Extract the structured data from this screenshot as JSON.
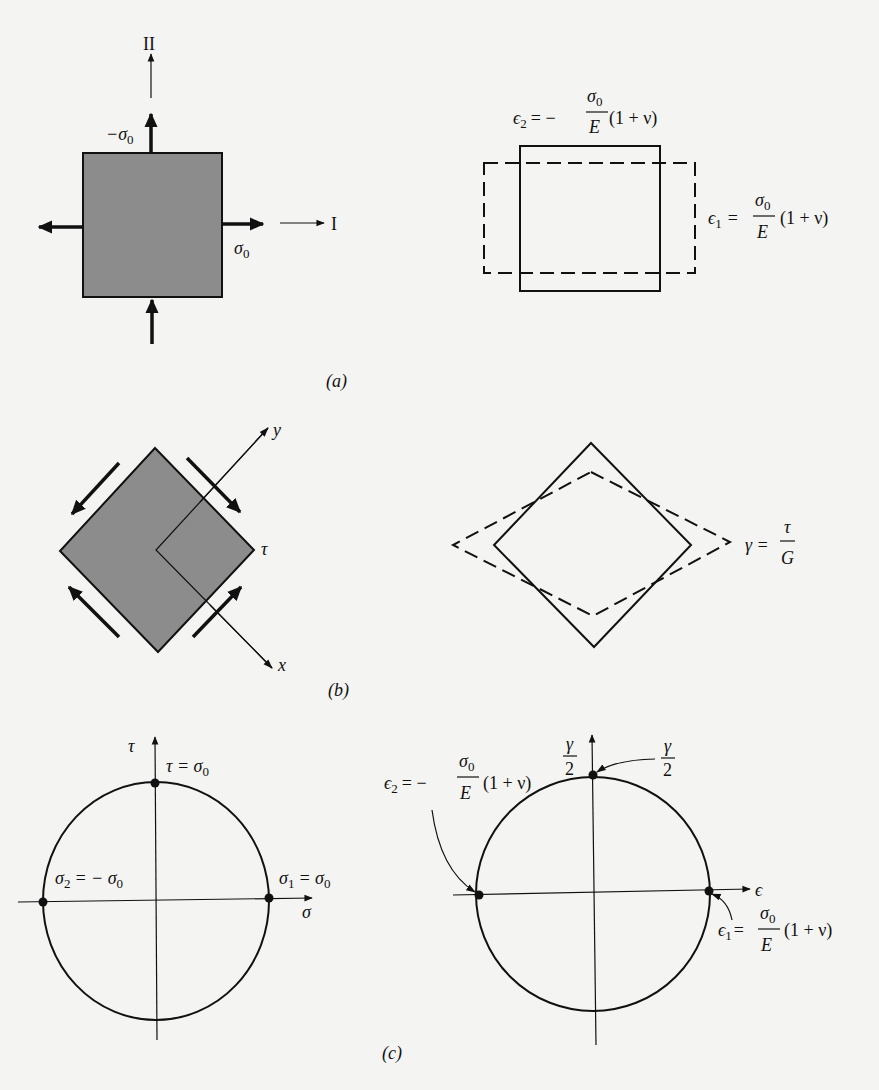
{
  "figure": {
    "panel_a": {
      "caption": "(a)",
      "axis_vertical_label": "II",
      "axis_horizontal_label": "I",
      "stress_top_label": "−σ",
      "stress_top_sub": "0",
      "stress_right_label": "σ",
      "stress_right_sub": "0",
      "strain2_lhs": "ϵ",
      "strain2_lhs_sub": "2",
      "strain2_eq": "= −",
      "strain2_num": "σ",
      "strain2_num_sub": "0",
      "strain2_den": "E",
      "strain2_tail": "(1 + ν)",
      "strain1_lhs": "ϵ",
      "strain1_lhs_sub": "1",
      "strain1_eq": "=",
      "strain1_num": "σ",
      "strain1_num_sub": "0",
      "strain1_den": "E",
      "strain1_tail": "(1 + ν)"
    },
    "panel_b": {
      "caption": "(b)",
      "axis_y_label": "y",
      "axis_x_label": "x",
      "shear_label": "τ",
      "gamma_lhs": "γ =",
      "gamma_num": "τ",
      "gamma_den": "G"
    },
    "panel_c": {
      "caption": "(c)",
      "left_circle": {
        "vertical_axis_label": "τ",
        "horizontal_axis_label": "σ",
        "top_point_label": "τ = σ",
        "top_point_sub": "0",
        "left_point_label": "σ",
        "left_point_sub": "2",
        "left_point_eq": "= − σ",
        "left_point_eq_sub": "0",
        "right_point_label": "σ",
        "right_point_sub": "1",
        "right_point_eq": "= σ",
        "right_point_eq_sub": "0"
      },
      "right_circle": {
        "vertical_axis_num": "γ",
        "vertical_axis_den": "2",
        "horizontal_axis_label": "ϵ",
        "top_point_num": "γ",
        "top_point_den": "2",
        "left_point_lhs": "ϵ",
        "left_point_lhs_sub": "2",
        "left_point_eq": "= −",
        "left_point_num": "σ",
        "left_point_num_sub": "0",
        "left_point_den": "E",
        "left_point_tail": "(1 + ν)",
        "right_point_lhs": "ϵ",
        "right_point_lhs_sub": "1",
        "right_point_eq": "=",
        "right_point_num": "σ",
        "right_point_num_sub": "0",
        "right_point_den": "E",
        "right_point_tail": "(1 + ν)"
      }
    },
    "colors": {
      "background": "#f4f4f2",
      "ink": "#111111",
      "element_fill": "#8c8c8c"
    }
  }
}
